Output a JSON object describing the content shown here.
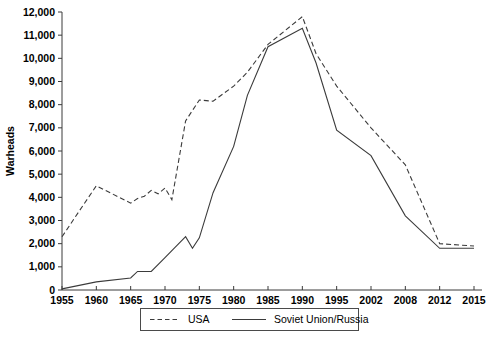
{
  "chart_data": {
    "type": "line",
    "title": "",
    "xlabel": "",
    "ylabel": "Warheads",
    "ylim": [
      0,
      12000
    ],
    "ytick_step": 1000,
    "grid": false,
    "legend_position": "bottom",
    "categories": [
      "1955",
      "1960",
      "1965",
      "1970",
      "1975",
      "1980",
      "1985",
      "1990",
      "1995",
      "2002",
      "2008",
      "2012",
      "2015"
    ],
    "ytick_labels": [
      "0",
      "1,000",
      "2,000",
      "3,000",
      "4,000",
      "5,000",
      "6,000",
      "7,000",
      "8,000",
      "9,000",
      "10,000",
      "11,000",
      "12,000"
    ],
    "series": [
      {
        "name": "USA",
        "style": "dashed",
        "color": "#3b3b3b",
        "x": [
          1955,
          1960,
          1963,
          1965,
          1966,
          1967,
          1968,
          1969,
          1970,
          1971,
          1973,
          1975,
          1977,
          1980,
          1982,
          1985,
          1990,
          1992,
          1995,
          2002,
          2008,
          2012,
          2015
        ],
        "values": [
          2300,
          4500,
          4050,
          3750,
          3950,
          4050,
          4300,
          4150,
          4400,
          3900,
          7300,
          8200,
          8150,
          8800,
          9400,
          10600,
          11800,
          10200,
          8800,
          7000,
          5400,
          2000,
          1900
        ]
      },
      {
        "name": "Soviet Union/Russia",
        "style": "solid",
        "color": "#3b3b3b",
        "x": [
          1955,
          1960,
          1965,
          1966,
          1968,
          1970,
          1973,
          1974,
          1975,
          1977,
          1980,
          1982,
          1985,
          1990,
          1992,
          1995,
          2002,
          2008,
          2012,
          2015
        ],
        "values": [
          50,
          350,
          520,
          800,
          800,
          1400,
          2300,
          1800,
          2250,
          4200,
          6200,
          8400,
          10500,
          11300,
          9800,
          6900,
          5800,
          3200,
          1800,
          1800
        ]
      }
    ],
    "legend_entries": [
      {
        "label": "USA",
        "style": "dashed"
      },
      {
        "label": "Soviet Union/Russia",
        "style": "solid"
      }
    ]
  }
}
